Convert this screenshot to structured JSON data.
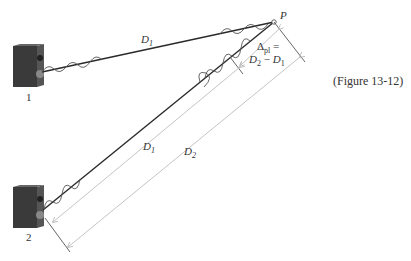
{
  "figure": {
    "caption": "(Figure 13-12)",
    "point_label": "P",
    "speakers": [
      {
        "label": "1"
      },
      {
        "label": "2"
      }
    ],
    "distances": {
      "path1_label": "D",
      "path1_sub": "1",
      "dim_d1_label": "D",
      "dim_d1_sub": "1",
      "dim_d2_label": "D",
      "dim_d2_sub": "2"
    },
    "path_difference": {
      "delta": "Δ",
      "delta_sub": "pl",
      "equals": " =",
      "d2": "D",
      "d2_sub": "2",
      "minus": " − ",
      "d1": "D",
      "d1_sub": "1"
    },
    "colors": {
      "ray": "#2a2a2a",
      "dimension": "#bdbdbd",
      "speaker_body": "#3a3a3a",
      "speaker_side": "#555555"
    }
  }
}
